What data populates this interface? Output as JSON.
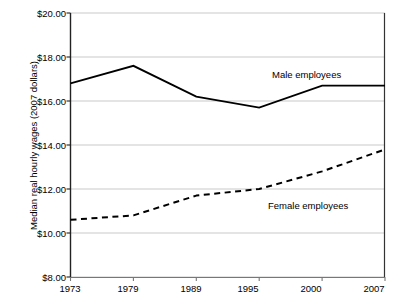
{
  "chart_data": {
    "type": "line",
    "title": "",
    "xlabel": "",
    "ylabel": "Median real hourly wages (2007 dollars)",
    "categories": [
      "1973",
      "1979",
      "1989",
      "1995",
      "2000",
      "2007"
    ],
    "ylim": [
      8.0,
      20.0
    ],
    "y_tick_labels": [
      "$20.00",
      "$18.00",
      "$16.00",
      "$14.00",
      "$12.00",
      "$10.00",
      "$8.00"
    ],
    "y_tick_values": [
      20.0,
      18.0,
      16.0,
      14.0,
      12.0,
      10.0,
      8.0
    ],
    "grid": "horizontal",
    "legend_position": "inline-annotations",
    "series": [
      {
        "name": "Male employees",
        "style": "solid",
        "color": "#000000",
        "values": [
          16.8,
          17.6,
          16.2,
          15.7,
          16.7,
          16.7
        ]
      },
      {
        "name": "Female employees",
        "style": "dashed",
        "color": "#000000",
        "values": [
          10.6,
          10.8,
          11.7,
          12.0,
          12.8,
          13.8
        ]
      }
    ],
    "annotations": [
      {
        "text": "Male employees",
        "x_px": 272,
        "y_px": 76
      },
      {
        "text": "Female employees",
        "x_px": 272,
        "y_px": 207
      }
    ]
  }
}
